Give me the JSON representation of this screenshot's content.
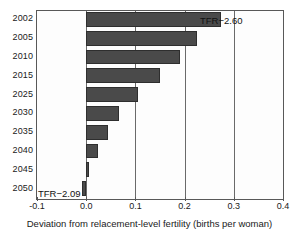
{
  "figure": {
    "background_color": "#ffffff",
    "bar_color": "#4a4a4a",
    "bar_edge_color": "#2e2e2e",
    "axis_color": "#585858",
    "grid_color": "#6a6a6a"
  },
  "chart_data": {
    "type": "bar",
    "orientation": "horizontal",
    "title": "",
    "xlabel": "Deviation from relacement-level fertility (births per woman)",
    "ylabel": "",
    "categories": [
      "2002",
      "2005",
      "2010",
      "2015",
      "2025",
      "2030",
      "2035",
      "2040",
      "2045",
      "2050"
    ],
    "values": [
      0.275,
      0.225,
      0.19,
      0.15,
      0.105,
      0.067,
      0.045,
      0.023,
      0.005,
      -0.008
    ],
    "xlim": [
      -0.1,
      0.4
    ],
    "ylim": [
      0,
      10
    ],
    "xticks": [
      -0.1,
      0.0,
      0.1,
      0.2,
      0.3,
      0.4
    ],
    "xtick_labels": [
      "-0.1",
      "0.0",
      "0.1",
      "0.2",
      "0.3",
      "0.4"
    ],
    "grid": "vertical-only",
    "gridline_values": [
      0.0,
      0.1,
      0.2,
      0.3
    ],
    "legend": "none",
    "annotations": [
      {
        "text": "TFR−2.60",
        "x": 0.28,
        "category": "2002"
      },
      {
        "text": "TFR−2.09",
        "x": -0.09,
        "category": "2050"
      }
    ]
  },
  "axis": {
    "x_title": "Deviation from relacement-level fertility (births per woman)",
    "x_tick_labels": [
      "-0.1",
      "0.0",
      "0.1",
      "0.2",
      "0.3",
      "0.4"
    ],
    "y_tick_labels": [
      "2002",
      "2005",
      "2010",
      "2015",
      "2025",
      "2030",
      "2035",
      "2040",
      "2045",
      "2050"
    ]
  },
  "annotations": {
    "top_label": "TFR−2.60",
    "bottom_label": "TFR−2.09"
  }
}
